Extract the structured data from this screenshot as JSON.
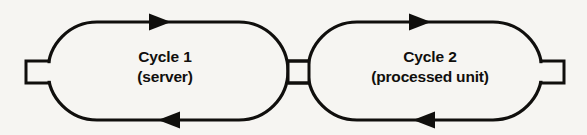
{
  "figure": {
    "kind": "cycle-diagram",
    "background_color": "#f6f5f2",
    "ink_color": "#100f0d",
    "stroke_width_px": 3,
    "width_px": 587,
    "height_px": 135
  },
  "cycles": [
    {
      "id": "cycle-1",
      "line_1": "Cycle 1",
      "line_2": "(server)",
      "top_arrow_direction": "right",
      "bottom_arrow_direction": "left"
    },
    {
      "id": "cycle-2",
      "line_1": "Cycle 2",
      "line_2": "(processed unit)",
      "top_arrow_direction": "right",
      "bottom_arrow_direction": "left"
    }
  ],
  "connectors": {
    "left_terminal": "square-port",
    "center_link": "square-link",
    "right_terminal": "square-port"
  },
  "icons": {
    "arrow_right": "arrow-right-icon",
    "arrow_left": "arrow-left-icon",
    "port": "square-port-icon"
  }
}
